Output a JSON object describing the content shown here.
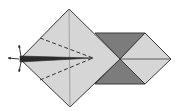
{
  "diagram": {
    "type": "origami-fold-step",
    "colors": {
      "background": "#ffffff",
      "paper_light": "#d6d6d6",
      "paper_dark": "#7c7c7c",
      "outline": "#3a3a3a",
      "crease": "#8a8a8a",
      "dash": "#333333",
      "flap": "#2a2a2a"
    },
    "shapes": {
      "main_diamond": [
        [
          69,
          9
        ],
        [
          120,
          59
        ],
        [
          70,
          107
        ],
        [
          20,
          59
        ]
      ],
      "dark_top_triangle": [
        [
          95,
          33
        ],
        [
          145,
          33
        ],
        [
          120,
          59
        ]
      ],
      "dark_bottom_triangle": [
        [
          95,
          84
        ],
        [
          145,
          84
        ],
        [
          120,
          59
        ]
      ],
      "right_light_diamond": [
        [
          120,
          59
        ],
        [
          145,
          33
        ],
        [
          171,
          59
        ],
        [
          145,
          84
        ]
      ],
      "center_flap_wedge": [
        [
          20,
          56
        ],
        [
          93,
          58
        ],
        [
          20,
          62
        ]
      ]
    },
    "lines": {
      "vertical_crease": [
        [
          69,
          9
        ],
        [
          70,
          107
        ]
      ],
      "right_horizontal_crease": [
        [
          120,
          59
        ],
        [
          171,
          59
        ]
      ],
      "dashed_fold_upper": [
        [
          40,
          38
        ],
        [
          93,
          58
        ]
      ],
      "dashed_fold_lower": [
        [
          40,
          80
        ],
        [
          93,
          58
        ]
      ]
    },
    "arrows": [
      {
        "name": "arrow-up",
        "from": [
          21,
          56
        ],
        "to": [
          19,
          45
        ]
      },
      {
        "name": "arrow-left",
        "from": [
          19,
          59
        ],
        "to": [
          8,
          58
        ]
      },
      {
        "name": "arrow-down",
        "from": [
          21,
          62
        ],
        "to": [
          19,
          72
        ]
      }
    ]
  }
}
